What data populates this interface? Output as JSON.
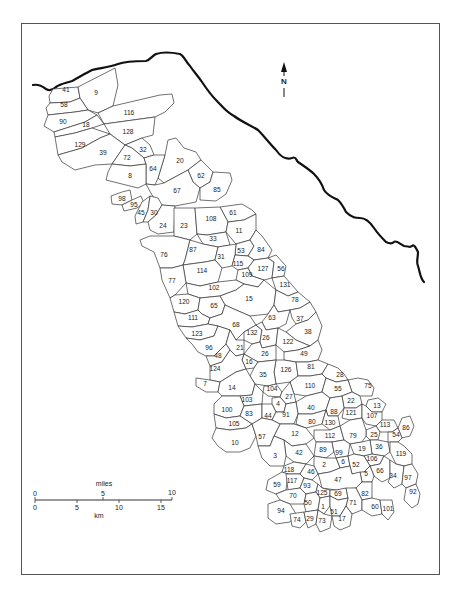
{
  "map": {
    "frame": {
      "x": 21,
      "y": 23,
      "width": 418,
      "height": 551
    },
    "north_arrow": {
      "label": "N",
      "x": 284,
      "y": 82
    },
    "scale_bar": {
      "miles_label": "miles",
      "km_label": "km",
      "miles_ticks": [
        "0",
        "5",
        "10"
      ],
      "km_ticks": [
        "0",
        "5",
        "10",
        "15"
      ],
      "miles_tick_x": [
        35,
        103,
        172
      ],
      "km_tick_x": [
        35,
        77,
        119,
        161
      ],
      "bar_y": 500
    },
    "colors": {
      "border": "#333333",
      "coastline": "#111111",
      "frame": "#555555",
      "background": "#ffffff"
    },
    "regions": [
      {
        "id": "41",
        "x": 66,
        "y": 90
      },
      {
        "id": "9",
        "x": 96,
        "y": 93
      },
      {
        "id": "58",
        "x": 64,
        "y": 105
      },
      {
        "id": "116",
        "x": 129,
        "y": 113
      },
      {
        "id": "90",
        "x": 63,
        "y": 122
      },
      {
        "id": "18",
        "x": 86,
        "y": 125
      },
      {
        "id": "128",
        "x": 128,
        "y": 132
      },
      {
        "id": "129",
        "x": 80,
        "y": 145
      },
      {
        "id": "39",
        "x": 103,
        "y": 153
      },
      {
        "id": "32",
        "x": 143,
        "y": 150
      },
      {
        "id": "72",
        "x": 127,
        "y": 158
      },
      {
        "id": "20",
        "x": 180,
        "y": 161
      },
      {
        "id": "64",
        "x": 153,
        "y": 169
      },
      {
        "id": "8",
        "x": 130,
        "y": 176
      },
      {
        "id": "62",
        "x": 201,
        "y": 176
      },
      {
        "id": "67",
        "x": 177,
        "y": 191
      },
      {
        "id": "85",
        "x": 217,
        "y": 190
      },
      {
        "id": "98",
        "x": 122,
        "y": 199
      },
      {
        "id": "95",
        "x": 134,
        "y": 205
      },
      {
        "id": "45",
        "x": 141,
        "y": 213
      },
      {
        "id": "30",
        "x": 154,
        "y": 213
      },
      {
        "id": "61",
        "x": 233,
        "y": 213
      },
      {
        "id": "24",
        "x": 163,
        "y": 226
      },
      {
        "id": "23",
        "x": 184,
        "y": 226
      },
      {
        "id": "108",
        "x": 211,
        "y": 219
      },
      {
        "id": "11",
        "x": 239,
        "y": 231
      },
      {
        "id": "33",
        "x": 213,
        "y": 239
      },
      {
        "id": "76",
        "x": 164,
        "y": 255
      },
      {
        "id": "87",
        "x": 193,
        "y": 250
      },
      {
        "id": "53",
        "x": 241,
        "y": 251
      },
      {
        "id": "84",
        "x": 261,
        "y": 250
      },
      {
        "id": "31",
        "x": 221,
        "y": 257
      },
      {
        "id": "115",
        "x": 238,
        "y": 264
      },
      {
        "id": "127",
        "x": 263,
        "y": 269
      },
      {
        "id": "56",
        "x": 281,
        "y": 269
      },
      {
        "id": "114",
        "x": 202,
        "y": 271
      },
      {
        "id": "109",
        "x": 247,
        "y": 275
      },
      {
        "id": "77",
        "x": 172,
        "y": 281
      },
      {
        "id": "131",
        "x": 285,
        "y": 285
      },
      {
        "id": "102",
        "x": 214,
        "y": 288
      },
      {
        "id": "15",
        "x": 249,
        "y": 299
      },
      {
        "id": "120",
        "x": 184,
        "y": 302
      },
      {
        "id": "65",
        "x": 214,
        "y": 306
      },
      {
        "id": "78",
        "x": 295,
        "y": 300
      },
      {
        "id": "111",
        "x": 193,
        "y": 318
      },
      {
        "id": "63",
        "x": 272,
        "y": 318
      },
      {
        "id": "37",
        "x": 300,
        "y": 319
      },
      {
        "id": "68",
        "x": 236,
        "y": 325
      },
      {
        "id": "123",
        "x": 197,
        "y": 334
      },
      {
        "id": "132",
        "x": 252,
        "y": 333
      },
      {
        "id": "26",
        "x": 266,
        "y": 338
      },
      {
        "id": "38",
        "x": 308,
        "y": 332
      },
      {
        "id": "122",
        "x": 288,
        "y": 342
      },
      {
        "id": "96",
        "x": 209,
        "y": 348
      },
      {
        "id": "21",
        "x": 240,
        "y": 348
      },
      {
        "id": "48",
        "x": 218,
        "y": 356
      },
      {
        "id": "26b",
        "label": "26",
        "x": 265,
        "y": 354
      },
      {
        "id": "49",
        "x": 304,
        "y": 354
      },
      {
        "id": "16",
        "x": 249,
        "y": 362
      },
      {
        "id": "124",
        "x": 215,
        "y": 369
      },
      {
        "id": "126",
        "x": 286,
        "y": 370
      },
      {
        "id": "81",
        "x": 311,
        "y": 367
      },
      {
        "id": "35",
        "x": 263,
        "y": 375
      },
      {
        "id": "28",
        "x": 340,
        "y": 375
      },
      {
        "id": "7",
        "x": 205,
        "y": 384
      },
      {
        "id": "14",
        "x": 232,
        "y": 388
      },
      {
        "id": "110",
        "x": 310,
        "y": 386
      },
      {
        "id": "75",
        "x": 368,
        "y": 386
      },
      {
        "id": "104",
        "x": 272,
        "y": 389
      },
      {
        "id": "55",
        "x": 338,
        "y": 389
      },
      {
        "id": "27",
        "x": 289,
        "y": 397
      },
      {
        "id": "22",
        "x": 351,
        "y": 401
      },
      {
        "id": "103",
        "x": 247,
        "y": 400
      },
      {
        "id": "4",
        "x": 278,
        "y": 404
      },
      {
        "id": "40",
        "x": 311,
        "y": 408
      },
      {
        "id": "13",
        "x": 377,
        "y": 406
      },
      {
        "id": "100",
        "x": 227,
        "y": 410
      },
      {
        "id": "88",
        "x": 334,
        "y": 412
      },
      {
        "id": "121",
        "x": 351,
        "y": 413
      },
      {
        "id": "83",
        "x": 249,
        "y": 414
      },
      {
        "id": "44",
        "x": 268,
        "y": 416
      },
      {
        "id": "91",
        "x": 286,
        "y": 415
      },
      {
        "id": "107",
        "x": 372,
        "y": 416
      },
      {
        "id": "80",
        "x": 312,
        "y": 422
      },
      {
        "id": "130",
        "x": 330,
        "y": 423
      },
      {
        "id": "105",
        "x": 234,
        "y": 424
      },
      {
        "id": "113",
        "x": 385,
        "y": 425
      },
      {
        "id": "86",
        "x": 406,
        "y": 428
      },
      {
        "id": "12",
        "x": 295,
        "y": 434
      },
      {
        "id": "54",
        "x": 396,
        "y": 435
      },
      {
        "id": "25",
        "x": 374,
        "y": 435
      },
      {
        "id": "112",
        "x": 330,
        "y": 436
      },
      {
        "id": "79",
        "x": 353,
        "y": 436
      },
      {
        "id": "10",
        "x": 235,
        "y": 443
      },
      {
        "id": "57",
        "x": 262,
        "y": 437
      },
      {
        "id": "36",
        "x": 379,
        "y": 447
      },
      {
        "id": "89",
        "x": 323,
        "y": 450
      },
      {
        "id": "19",
        "x": 362,
        "y": 449
      },
      {
        "id": "42",
        "x": 299,
        "y": 453
      },
      {
        "id": "99",
        "x": 339,
        "y": 453
      },
      {
        "id": "119",
        "x": 401,
        "y": 454
      },
      {
        "id": "3",
        "x": 275,
        "y": 456
      },
      {
        "id": "106",
        "x": 372,
        "y": 459
      },
      {
        "id": "6",
        "x": 343,
        "y": 462
      },
      {
        "id": "52",
        "x": 356,
        "y": 465
      },
      {
        "id": "112b",
        "label": "2",
        "x": 324,
        "y": 465
      },
      {
        "id": "66",
        "x": 380,
        "y": 471
      },
      {
        "id": "118",
        "x": 289,
        "y": 470
      },
      {
        "id": "46",
        "x": 311,
        "y": 472
      },
      {
        "id": "34",
        "x": 393,
        "y": 476
      },
      {
        "id": "5",
        "x": 366,
        "y": 474
      },
      {
        "id": "97",
        "x": 408,
        "y": 478
      },
      {
        "id": "59",
        "x": 277,
        "y": 485
      },
      {
        "id": "117",
        "x": 292,
        "y": 481
      },
      {
        "id": "47",
        "x": 338,
        "y": 480
      },
      {
        "id": "93",
        "x": 307,
        "y": 486
      },
      {
        "id": "92",
        "x": 413,
        "y": 492
      },
      {
        "id": "125",
        "x": 322,
        "y": 493
      },
      {
        "id": "69",
        "x": 338,
        "y": 494
      },
      {
        "id": "70",
        "x": 293,
        "y": 496
      },
      {
        "id": "82",
        "x": 365,
        "y": 494
      },
      {
        "id": "71",
        "x": 353,
        "y": 503
      },
      {
        "id": "50",
        "x": 308,
        "y": 503
      },
      {
        "id": "1",
        "x": 323,
        "y": 507
      },
      {
        "id": "60",
        "x": 375,
        "y": 507
      },
      {
        "id": "101",
        "x": 388,
        "y": 509
      },
      {
        "id": "51",
        "x": 334,
        "y": 512
      },
      {
        "id": "94",
        "x": 281,
        "y": 511
      },
      {
        "id": "74",
        "x": 297,
        "y": 520
      },
      {
        "id": "29",
        "x": 310,
        "y": 519
      },
      {
        "id": "73",
        "x": 322,
        "y": 521
      },
      {
        "id": "17",
        "x": 342,
        "y": 519
      }
    ]
  }
}
